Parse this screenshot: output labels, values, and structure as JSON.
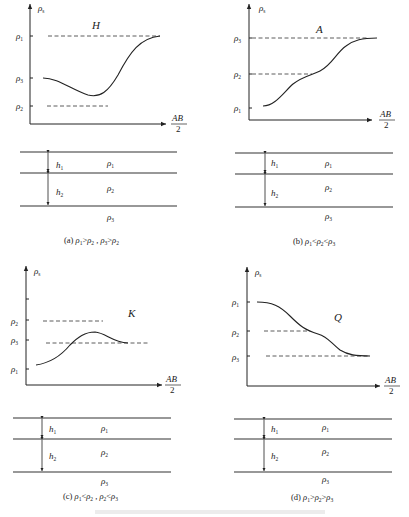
{
  "figure": {
    "panels": [
      {
        "id": "a",
        "curve_label": "H",
        "y_axis_label": "ρs",
        "x_axis_label_num": "AB",
        "x_axis_label_den": "2",
        "y_ticks": [
          "ρ1",
          "ρ3",
          "ρ2"
        ],
        "layers": {
          "h_labels": [
            "h1",
            "h2"
          ],
          "rho_labels": [
            "ρ1",
            "ρ2",
            "ρ3"
          ]
        },
        "caption": "(a) ρ1>ρ2 , ρ3>ρ2"
      },
      {
        "id": "b",
        "curve_label": "A",
        "y_axis_label": "ρs",
        "x_axis_label_num": "AB",
        "x_axis_label_den": "2",
        "y_ticks": [
          "ρ3",
          "ρ2",
          "ρ1"
        ],
        "layers": {
          "h_labels": [
            "h1",
            "h2"
          ],
          "rho_labels": [
            "ρ1",
            "ρ2",
            "ρ3"
          ]
        },
        "caption": "(b) ρ1<ρ2<ρ3"
      },
      {
        "id": "c",
        "curve_label": "K",
        "y_axis_label": "ρs",
        "x_axis_label_num": "AB",
        "x_axis_label_den": "2",
        "y_ticks": [
          "ρ2",
          "ρ3",
          "ρ1"
        ],
        "layers": {
          "h_labels": [
            "h1",
            "h2"
          ],
          "rho_labels": [
            "ρ1",
            "ρ2",
            "ρ3"
          ]
        },
        "caption": "(c) ρ1<ρ2 , ρ2<ρ3"
      },
      {
        "id": "d",
        "curve_label": "Q",
        "y_axis_label": "ρs",
        "x_axis_label_num": "AB",
        "x_axis_label_den": "2",
        "y_ticks": [
          "ρ1",
          "ρ2",
          "ρ3"
        ],
        "layers": {
          "h_labels": [
            "h1",
            "h2"
          ],
          "rho_labels": [
            "ρ1",
            "ρ2",
            "ρ3"
          ]
        },
        "caption": "(d) ρ1>ρ2>ρ3"
      }
    ]
  }
}
